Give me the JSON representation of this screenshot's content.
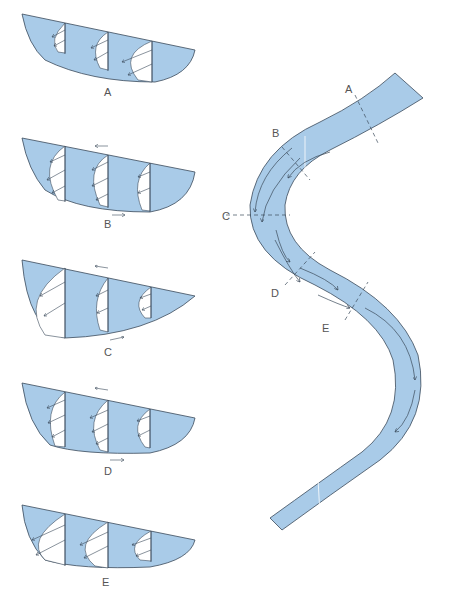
{
  "diagram": {
    "type": "river meander cross-sections",
    "colors": {
      "water": "#a9cbe8",
      "water_dark": "#8fb6dc",
      "outline": "#3b4a5a",
      "profile_fill": "#ffffff",
      "label": "#555555"
    },
    "sections": [
      {
        "label": "A",
        "position": "straight reach upstream"
      },
      {
        "label": "B",
        "position": "entering bend"
      },
      {
        "label": "C",
        "position": "apex of bend"
      },
      {
        "label": "D",
        "position": "leaving bend"
      },
      {
        "label": "E",
        "position": "straight reach downstream"
      }
    ],
    "map_labels": [
      "A",
      "B",
      "C",
      "D",
      "E"
    ]
  }
}
